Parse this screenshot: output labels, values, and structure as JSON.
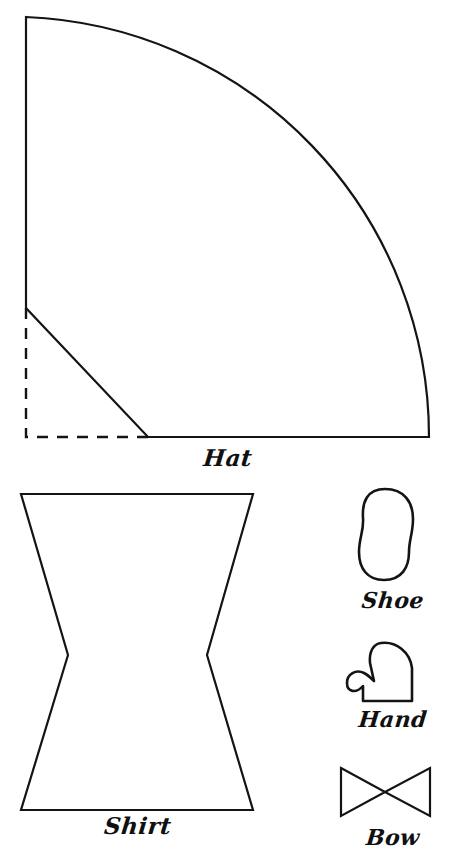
{
  "page": {
    "background_color": "#ffffff",
    "ink_color": "#141414",
    "width": 456,
    "height": 863
  },
  "parts": {
    "hat": {
      "label": "Hat",
      "shape": "quarter-circle",
      "description": "Quarter circle cone pattern with corner trimmed off; dashed fold lines mark the removed corner",
      "geometry": {
        "center": [
          26,
          437
        ],
        "radius": 420,
        "top_point": [
          26,
          17
        ],
        "right_point": [
          429,
          437
        ],
        "bevel_start": [
          26,
          308
        ],
        "bevel_end": [
          148,
          437
        ]
      },
      "line_style": "solid outline with dashed inner corner guides"
    },
    "shirt": {
      "label": "Shirt",
      "shape": "hourglass",
      "description": "Hourglass / bowtie shaped tunic piece with notched waist",
      "geometry": {
        "top_left": [
          21,
          494
        ],
        "top_right": [
          253,
          494
        ],
        "waist_left": [
          68,
          655
        ],
        "waist_right": [
          207,
          655
        ],
        "bottom_left": [
          21,
          810
        ],
        "bottom_right": [
          253,
          810
        ]
      },
      "line_style": "solid"
    },
    "shoe": {
      "label": "Shoe",
      "shape": "rounded-foot",
      "description": "Rounded peanut shaped sole with a slight waist at the arch",
      "geometry": {
        "bounds": [
          357,
          489,
          56,
          92
        ]
      },
      "line_style": "solid"
    },
    "hand": {
      "label": "Hand",
      "shape": "mitten",
      "description": "Mitten outline with thumb extending to the left and flat wrist edge",
      "geometry": {
        "bounds": [
          347,
          642,
          66,
          60
        ]
      },
      "line_style": "solid"
    },
    "bow": {
      "label": "Bow",
      "shape": "bowtie",
      "description": "Bow tie shape with V notches top and bottom centre",
      "geometry": {
        "left": 341,
        "top": 768,
        "right": 430,
        "bottom": 816,
        "center_x": 385
      },
      "line_style": "solid"
    }
  }
}
